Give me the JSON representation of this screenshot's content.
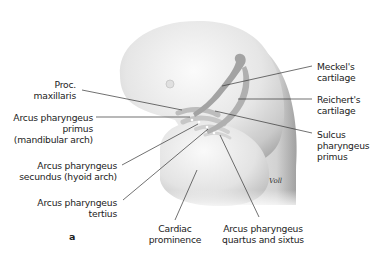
{
  "figure": {
    "letter": "a",
    "signature": "Voll"
  },
  "labels": {
    "proc_maxillaris": [
      "Proc.",
      "maxillaris"
    ],
    "arcus_primus": [
      "Arcus pharyngeus",
      "primus",
      "(mandibular arch)"
    ],
    "arcus_secundus": [
      "Arcus pharyngeus",
      "secundus (hyoid arch)"
    ],
    "arcus_tertius": [
      "Arcus pharyngeus",
      "tertius"
    ],
    "cardiac": [
      "Cardiac",
      "prominence"
    ],
    "arcus_quartus": [
      "Arcus pharyngeus",
      "quartus and sixtus"
    ],
    "meckel": [
      "Meckel's",
      "cartilage"
    ],
    "reichert": [
      "Reichert's",
      "cartilage"
    ],
    "sulcus": [
      "Sulcus",
      "pharyngeus",
      "primus"
    ]
  },
  "colors": {
    "body_light": "#f2f2f2",
    "body_mid": "#d6d6d6",
    "body_dark": "#a8a8a8",
    "cartilage": "#9a9a9a",
    "leader_line": "#333333",
    "text": "#222222"
  }
}
